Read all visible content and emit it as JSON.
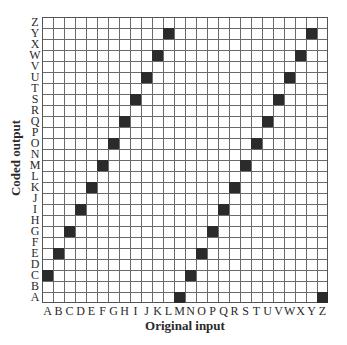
{
  "chart_data": {
    "type": "heatmap",
    "title": "",
    "xlabel": "Original input",
    "ylabel": "Coded output",
    "x_ticks": [
      "A",
      "B",
      "C",
      "D",
      "E",
      "F",
      "G",
      "H",
      "I",
      "J",
      "K",
      "L",
      "M",
      "N",
      "O",
      "P",
      "Q",
      "R",
      "S",
      "T",
      "U",
      "V",
      "W",
      "X",
      "Y",
      "Z"
    ],
    "y_ticks": [
      "A",
      "B",
      "C",
      "D",
      "E",
      "F",
      "G",
      "H",
      "I",
      "J",
      "K",
      "L",
      "M",
      "N",
      "O",
      "P",
      "Q",
      "R",
      "S",
      "T",
      "U",
      "V",
      "W",
      "X",
      "Y",
      "Z"
    ],
    "grid": true,
    "filled_cells": [
      {
        "input": "A",
        "output": "C"
      },
      {
        "input": "B",
        "output": "E"
      },
      {
        "input": "C",
        "output": "G"
      },
      {
        "input": "D",
        "output": "I"
      },
      {
        "input": "E",
        "output": "K"
      },
      {
        "input": "F",
        "output": "M"
      },
      {
        "input": "G",
        "output": "O"
      },
      {
        "input": "H",
        "output": "Q"
      },
      {
        "input": "I",
        "output": "S"
      },
      {
        "input": "J",
        "output": "U"
      },
      {
        "input": "K",
        "output": "W"
      },
      {
        "input": "L",
        "output": "Y"
      },
      {
        "input": "M",
        "output": "A"
      },
      {
        "input": "N",
        "output": "C"
      },
      {
        "input": "O",
        "output": "E"
      },
      {
        "input": "P",
        "output": "G"
      },
      {
        "input": "Q",
        "output": "I"
      },
      {
        "input": "R",
        "output": "K"
      },
      {
        "input": "S",
        "output": "M"
      },
      {
        "input": "T",
        "output": "O"
      },
      {
        "input": "U",
        "output": "Q"
      },
      {
        "input": "V",
        "output": "S"
      },
      {
        "input": "W",
        "output": "U"
      },
      {
        "input": "X",
        "output": "W"
      },
      {
        "input": "Y",
        "output": "Y"
      },
      {
        "input": "Z",
        "output": "A"
      }
    ],
    "fill_color": "#2b2b2b",
    "grid_color": "#6a6a6a"
  },
  "axes": {
    "xlabel": "Original input",
    "ylabel": "Coded output"
  }
}
